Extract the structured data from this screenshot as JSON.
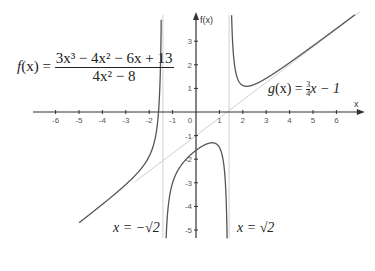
{
  "chart_data": {
    "type": "line",
    "title": "",
    "xlabel": "x",
    "ylabel": "f(x)",
    "xlim": [
      -7,
      7
    ],
    "ylim": [
      -6,
      4
    ],
    "grid": false,
    "x_ticks": [
      -6,
      -5,
      -4,
      -3,
      -2,
      -1,
      0,
      1,
      2,
      3,
      4,
      5,
      6
    ],
    "y_ticks": [
      -5,
      -4,
      -3,
      -2,
      -1,
      1,
      2,
      3
    ],
    "series": [
      {
        "name": "f(x) = (3x^3 - 4x^2 - 6x + 13)/(4x^2 - 8)",
        "color": "#555555",
        "kind": "rational-function",
        "numerator": [
          3,
          -4,
          -6,
          13
        ],
        "denominator": [
          4,
          0,
          -8
        ]
      },
      {
        "name": "g(x) = 3/4 x - 1",
        "color": "#d0d0d0",
        "kind": "oblique-asymptote",
        "slope": 0.75,
        "intercept": -1
      },
      {
        "name": "x = -√2",
        "color": "#d0d0d0",
        "kind": "vertical-asymptote",
        "x": -1.41421
      },
      {
        "name": "x = √2",
        "color": "#d0d0d0",
        "kind": "vertical-asymptote",
        "x": 1.41421
      }
    ],
    "annotations": [
      {
        "text": "f(x) = (3x³ − 4x² − 6x + 13) / (4x² − 8)",
        "position": "top-left"
      },
      {
        "text": "g(x) = ¾x − 1",
        "position": "right, above x-axis"
      },
      {
        "text": "x = −√2",
        "position": "bottom, left of asymptote"
      },
      {
        "text": "x = √2",
        "position": "bottom, right of asymptote"
      }
    ]
  },
  "labels": {
    "x_axis": "x",
    "y_axis": "f(x)",
    "f_lhs": "f",
    "f_arg": "(x) =",
    "f_num": "3x³ − 4x² − 6x + 13",
    "f_den": "4x² − 8",
    "g_lhs": "g",
    "g_arg": "(x) =",
    "g_frac_num": "3",
    "g_frac_den": "4",
    "g_rest": "x − 1",
    "asym_left": "x = −√2",
    "asym_right": "x = √2"
  }
}
